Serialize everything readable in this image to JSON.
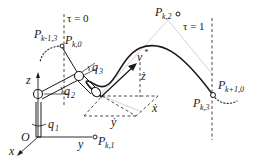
{
  "diagram": {
    "labels": {
      "tau_start": "τ = 0",
      "tau_end": "τ = 1",
      "origin": "O",
      "axis_x": "x",
      "axis_y": "y",
      "axis_z": "z",
      "joint_q1": "q",
      "joint_q1_sub": "1",
      "joint_q2": "q",
      "joint_q2_sub": "2",
      "joint_q3": "q",
      "joint_q3_sub": "3",
      "velocity": "v",
      "velocity_sup": "*",
      "vel_x": "ẋ",
      "vel_y": "ẏ",
      "vel_z": "ż"
    },
    "control_points": [
      {
        "id": "pk0",
        "main": "P",
        "sub": "k,0"
      },
      {
        "id": "pk1",
        "main": "P",
        "sub": "k,1"
      },
      {
        "id": "pk2",
        "main": "P",
        "sub": "k,2"
      },
      {
        "id": "pk3",
        "main": "P",
        "sub": "k,3"
      },
      {
        "id": "pkm13",
        "main": "P",
        "sub": "k-1,3"
      },
      {
        "id": "pkp10",
        "main": "P",
        "sub": "k+1,0"
      }
    ],
    "colors": {
      "ink": "#1a1a1a",
      "control_polygon": "#c8c8c8",
      "background": "#ffffff"
    }
  }
}
